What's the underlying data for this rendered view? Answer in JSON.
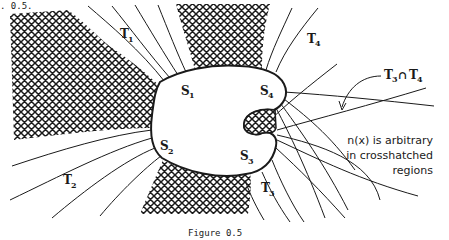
{
  "header_fragment": ". 0.5.",
  "figure": {
    "caption": "Figure 0.5",
    "labels": {
      "T1": {
        "main": "T",
        "sub": "1"
      },
      "T2": {
        "main": "T",
        "sub": "2"
      },
      "T3": {
        "main": "T",
        "sub": "3"
      },
      "T4": {
        "main": "T",
        "sub": "4"
      },
      "S1": {
        "main": "S",
        "sub": "1"
      },
      "S2": {
        "main": "S",
        "sub": "2"
      },
      "S3": {
        "main": "S",
        "sub": "3"
      },
      "S4": {
        "main": "S",
        "sub": "4"
      }
    },
    "intersection_label": {
      "left": "T",
      "left_sub": "3",
      "op": "∩",
      "right": "T",
      "right_sub": "4"
    },
    "annotation": [
      "n(x) is arbitrary",
      "in crosshatched",
      "regions"
    ],
    "colors": {
      "ink": "#1a1a1a",
      "paper": "#ffffff"
    }
  }
}
